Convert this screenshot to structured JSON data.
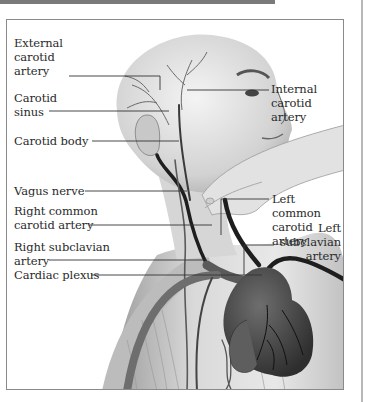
{
  "figure": {
    "labels_left": [
      {
        "id": "external-carotid-artery",
        "text": "External\ncarotid\nartery"
      },
      {
        "id": "carotid-sinus",
        "text": "Carotid\nsinus"
      },
      {
        "id": "carotid-body",
        "text": "Carotid body"
      },
      {
        "id": "vagus-nerve",
        "text": "Vagus nerve"
      },
      {
        "id": "right-common-carotid-artery",
        "text": "Right common\ncarotid artery"
      },
      {
        "id": "right-subclavian-artery",
        "text": "Right subclavian\nartery"
      },
      {
        "id": "cardiac-plexus",
        "text": "Cardiac plexus"
      }
    ],
    "labels_right": [
      {
        "id": "internal-carotid-artery",
        "text": "Internal\ncarotid\nartery"
      },
      {
        "id": "left-common-carotid-artery",
        "text": "Left common\ncarotid artery"
      },
      {
        "id": "left-subclavian-artery",
        "text": "Left\nsubclavian\nartery"
      }
    ],
    "colors": {
      "frame": "#8a8a8a",
      "leader_line": "#333333",
      "vessel": "#1e1e1e",
      "skin_light": "#e6e6e6",
      "skin_mid": "#bdbdbd",
      "heart": "#4a4a4a"
    }
  }
}
